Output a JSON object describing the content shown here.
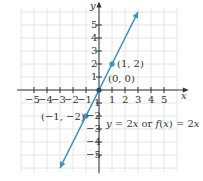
{
  "chart_data": {
    "type": "line",
    "title": "",
    "xlabel": "x",
    "ylabel": "y",
    "xlim": [
      -6,
      6
    ],
    "ylim": [
      -6,
      6
    ],
    "grid": true,
    "x_ticks": [
      -5,
      -4,
      -3,
      -2,
      -1,
      1,
      2,
      3,
      4,
      5
    ],
    "y_ticks": [
      -5,
      -4,
      -3,
      -2,
      -1,
      1,
      2,
      3,
      4,
      5
    ],
    "x_tick_labels": [
      "−5",
      "−4",
      "−3",
      "−2",
      "−1",
      "1",
      "2",
      "3",
      "4",
      "5"
    ],
    "y_tick_labels": [
      "−5",
      "−4",
      "−3",
      "−2",
      "−1",
      "1",
      "2",
      "3",
      "4",
      "5"
    ],
    "series": [
      {
        "name": "y = 2x",
        "equation": "y = 2x or f(x) = 2x",
        "slope": 2,
        "intercept": 0,
        "x_range": [
          -3,
          3
        ],
        "color": "#3a8fc4",
        "arrows": "both"
      }
    ],
    "points": [
      {
        "x": 1,
        "y": 2,
        "label": "(1, 2)"
      },
      {
        "x": 0,
        "y": 0,
        "label": "(0, 0)"
      },
      {
        "x": -1,
        "y": -2,
        "label": "(−1, −2)"
      }
    ],
    "annotations": [
      "y = 2x or f(x) = 2x"
    ]
  },
  "labels": {
    "axis_x": "x",
    "axis_y": "y",
    "pt1": "(1, 2)",
    "pt0": "(0, 0)",
    "ptm1": "(−1, −2)",
    "eq_y": "y",
    "eq_mid": " = 2",
    "eq_x1": "x",
    "eq_or": " or ",
    "eq_f": "f",
    "eq_paren": "(",
    "eq_x2": "x",
    "eq_paren2": ") = 2",
    "eq_x3": "x"
  },
  "colors": {
    "line": "#3a8fc4",
    "grid": "#e4e4e4",
    "axis": "#333333"
  }
}
